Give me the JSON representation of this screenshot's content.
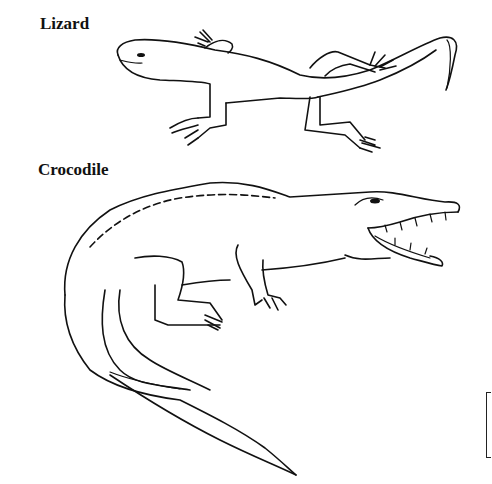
{
  "figure": {
    "panels": [
      {
        "label": "Lizard",
        "subject": "lizard-drawing"
      },
      {
        "label": "Crocodile",
        "subject": "crocodile-drawing"
      }
    ]
  },
  "colors": {
    "ink": "#111111",
    "background": "#ffffff"
  }
}
